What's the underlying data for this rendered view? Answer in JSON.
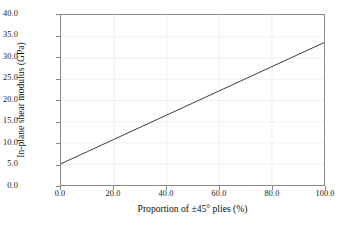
{
  "chart_data": {
    "type": "line",
    "title": "",
    "xlabel": "Proportion of ±45° plies (%)",
    "ylabel": "In-plane shear modulus (GPa)",
    "xlim": [
      0.0,
      100.0
    ],
    "ylim": [
      0.0,
      40.0
    ],
    "xticks": [
      0.0,
      20.0,
      40.0,
      60.0,
      80.0,
      100.0
    ],
    "yticks": [
      0.0,
      5.0,
      10.0,
      15.0,
      20.0,
      25.0,
      30.0,
      35.0,
      40.0
    ],
    "xtick_labels": [
      "0.0",
      "20.0",
      "40.0",
      "60.0",
      "80.0",
      "100.0"
    ],
    "ytick_labels": [
      "0.0",
      "5.0",
      "10.0",
      "15.0",
      "20.0",
      "25.0",
      "30.0",
      "35.0",
      "40.0"
    ],
    "grid": true,
    "legend": "none",
    "series": [
      {
        "name": "In-plane shear modulus",
        "color": "#3a3a3a",
        "x": [
          0.0,
          10.0,
          20.0,
          30.0,
          40.0,
          50.0,
          60.0,
          70.0,
          80.0,
          90.0,
          100.0
        ],
        "values": [
          5.0,
          7.85,
          10.7,
          13.55,
          16.4,
          19.25,
          22.1,
          24.95,
          27.8,
          30.65,
          33.5
        ]
      }
    ]
  },
  "style": {
    "axis_color": "#8a8a8a",
    "grid_color": "#f0f0f0",
    "line_color": "#3a3a3a",
    "text_color": "#111111",
    "background": "#ffffff"
  }
}
